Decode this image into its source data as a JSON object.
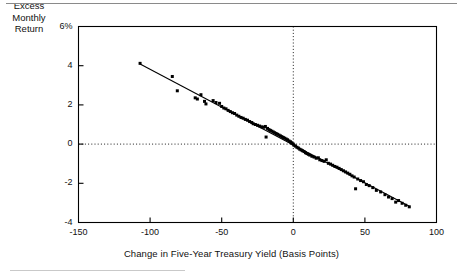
{
  "figure": {
    "has_top_rule": true,
    "has_bottom_rule": true,
    "background_color": "#ffffff",
    "ink_color": "#000000"
  },
  "axis_titles": {
    "x": "Change in Five-Year Treasury Yield (Basis Points)",
    "y_line1": "Excess",
    "y_line2": "Monthly",
    "y_line3": "Return"
  },
  "ticks": {
    "x": [
      "-150",
      "-100",
      "-50",
      "0",
      "50",
      "100"
    ],
    "y": [
      "-4",
      "-2",
      "0",
      "2",
      "4",
      "6%"
    ]
  },
  "chart_data": {
    "type": "scatter",
    "title": "",
    "xlabel": "Change in Five-Year Treasury Yield (Basis Points)",
    "ylabel": "Excess Monthly Return",
    "xlim": [
      -150,
      100
    ],
    "ylim": [
      -4,
      6
    ],
    "xticks": [
      -150,
      -100,
      -50,
      0,
      50,
      100
    ],
    "yticks": [
      -4,
      -2,
      0,
      2,
      4,
      6
    ],
    "ytick_labels": [
      "-4",
      "-2",
      "0",
      "2",
      "4",
      "6%"
    ],
    "grid": false,
    "legend": null,
    "reference_lines": [
      {
        "orientation": "horizontal",
        "value": 0,
        "style": "dotted"
      },
      {
        "orientation": "vertical",
        "value": 0,
        "style": "dotted"
      }
    ],
    "fit_line": {
      "type": "linear",
      "slope": -0.0386,
      "intercept": -0.04,
      "x_start": -107,
      "x_end": 81,
      "style": "solid"
    },
    "marker": {
      "shape": "square",
      "size": 3,
      "color": "#000000"
    },
    "series": [
      {
        "name": "Excess Monthly Return vs Yield Change",
        "points": [
          [
            -107.0,
            4.12
          ],
          [
            -84.5,
            3.45
          ],
          [
            -81.0,
            2.72
          ],
          [
            -68.5,
            2.36
          ],
          [
            -67.0,
            2.3
          ],
          [
            -64.5,
            2.52
          ],
          [
            -62.0,
            2.18
          ],
          [
            -61.0,
            2.05
          ],
          [
            -56.0,
            2.22
          ],
          [
            -54.0,
            2.12
          ],
          [
            -51.5,
            2.08
          ],
          [
            -50.0,
            1.92
          ],
          [
            -48.5,
            1.84
          ],
          [
            -47.0,
            1.8
          ],
          [
            -45.5,
            1.72
          ],
          [
            -44.0,
            1.66
          ],
          [
            -42.5,
            1.6
          ],
          [
            -41.0,
            1.56
          ],
          [
            -39.5,
            1.48
          ],
          [
            -38.0,
            1.42
          ],
          [
            -36.5,
            1.36
          ],
          [
            -35.0,
            1.32
          ],
          [
            -33.5,
            1.26
          ],
          [
            -32.0,
            1.22
          ],
          [
            -30.5,
            1.15
          ],
          [
            -29.0,
            1.1
          ],
          [
            -28.0,
            1.04
          ],
          [
            -26.5,
            1.0
          ],
          [
            -25.0,
            0.96
          ],
          [
            -23.5,
            0.92
          ],
          [
            -22.0,
            0.88
          ],
          [
            -20.5,
            0.86
          ],
          [
            -19.5,
            0.9
          ],
          [
            -19.0,
            0.36
          ],
          [
            -18.0,
            0.8
          ],
          [
            -17.0,
            0.74
          ],
          [
            -16.0,
            0.7
          ],
          [
            -15.0,
            0.66
          ],
          [
            -14.0,
            0.62
          ],
          [
            -13.0,
            0.58
          ],
          [
            -12.0,
            0.54
          ],
          [
            -11.0,
            0.5
          ],
          [
            -10.0,
            0.46
          ],
          [
            -9.0,
            0.42
          ],
          [
            -8.0,
            0.38
          ],
          [
            -7.0,
            0.34
          ],
          [
            -6.0,
            0.3
          ],
          [
            -5.0,
            0.26
          ],
          [
            -4.0,
            0.22
          ],
          [
            -3.0,
            0.16
          ],
          [
            -2.0,
            0.12
          ],
          [
            -1.5,
            0.08
          ],
          [
            -1.0,
            0.04
          ],
          [
            0.0,
            0.0
          ],
          [
            0.5,
            -0.06
          ],
          [
            1.5,
            -0.1
          ],
          [
            2.5,
            -0.16
          ],
          [
            3.5,
            -0.2
          ],
          [
            4.5,
            -0.26
          ],
          [
            5.5,
            -0.3
          ],
          [
            6.5,
            -0.34
          ],
          [
            7.5,
            -0.38
          ],
          [
            8.5,
            -0.44
          ],
          [
            9.5,
            -0.48
          ],
          [
            10.5,
            -0.52
          ],
          [
            11.5,
            -0.56
          ],
          [
            13.0,
            -0.62
          ],
          [
            14.5,
            -0.66
          ],
          [
            16.0,
            -0.72
          ],
          [
            17.5,
            -0.7
          ],
          [
            18.5,
            -0.8
          ],
          [
            20.0,
            -0.84
          ],
          [
            21.5,
            -0.88
          ],
          [
            23.0,
            -0.8
          ],
          [
            24.5,
            -0.98
          ],
          [
            26.0,
            -1.02
          ],
          [
            27.5,
            -1.08
          ],
          [
            29.0,
            -1.14
          ],
          [
            30.5,
            -1.18
          ],
          [
            32.0,
            -1.24
          ],
          [
            33.5,
            -1.3
          ],
          [
            35.0,
            -1.36
          ],
          [
            36.5,
            -1.42
          ],
          [
            38.0,
            -1.48
          ],
          [
            39.5,
            -1.54
          ],
          [
            41.0,
            -1.62
          ],
          [
            42.5,
            -1.68
          ],
          [
            43.5,
            -2.28
          ],
          [
            45.0,
            -1.78
          ],
          [
            47.0,
            -1.86
          ],
          [
            49.0,
            -1.92
          ],
          [
            51.0,
            -2.06
          ],
          [
            53.0,
            -2.12
          ],
          [
            55.5,
            -2.22
          ],
          [
            58.0,
            -2.36
          ],
          [
            61.0,
            -2.44
          ],
          [
            64.0,
            -2.58
          ],
          [
            66.5,
            -2.7
          ],
          [
            69.0,
            -2.78
          ],
          [
            71.5,
            -2.96
          ],
          [
            73.5,
            -2.88
          ],
          [
            76.0,
            -3.02
          ],
          [
            78.5,
            -3.12
          ],
          [
            81.0,
            -3.2
          ]
        ]
      }
    ]
  }
}
